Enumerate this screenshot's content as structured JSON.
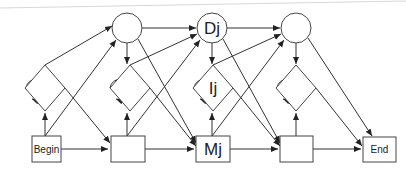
{
  "diagram": {
    "type": "profile-hmm",
    "labels": {
      "begin": "Begin",
      "end": "End",
      "delete_j": "Dj",
      "insert_j": "Ij",
      "match_j": "Mj"
    },
    "node_types": {
      "delete": "circle",
      "insert": "diamond",
      "match": "rectangle"
    },
    "columns": 4,
    "colors": {
      "stroke": "#444444",
      "fill": "#ffffff",
      "text": "#222222",
      "background": "#ffffff"
    }
  }
}
